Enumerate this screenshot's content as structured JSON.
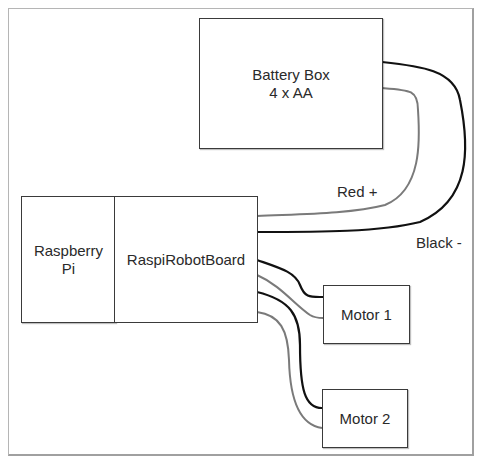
{
  "diagram": {
    "nodes": {
      "battery": {
        "line1": "Battery Box",
        "line2": "4 x AA"
      },
      "raspberry_pi": {
        "line1": "Raspberry",
        "line2": "Pi"
      },
      "robot_board": {
        "label": "RaspiRobotBoard"
      },
      "motor1": {
        "label": "Motor 1"
      },
      "motor2": {
        "label": "Motor 2"
      }
    },
    "wire_labels": {
      "red": "Red +",
      "black": "Black -"
    },
    "colors": {
      "black_wire": "#111111",
      "red_wire": "#7a7a7a",
      "box_border": "#3a3a3a"
    }
  }
}
